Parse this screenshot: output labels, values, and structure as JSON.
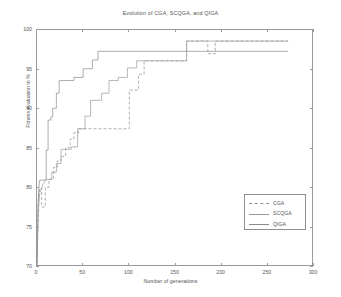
{
  "chart_data": {
    "type": "line",
    "title": "Evolution of CGA, SCQGA, and QIGA",
    "xlabel": "Number of generations",
    "ylabel": "Fitness evaluation in %",
    "xlim": [
      0,
      300
    ],
    "ylim": [
      70,
      100
    ],
    "xticks": [
      0,
      50,
      100,
      150,
      200,
      250,
      300
    ],
    "yticks": [
      70,
      75,
      80,
      85,
      90,
      95,
      100
    ],
    "grid": false,
    "legend_position": "lower-right-inside",
    "series": [
      {
        "name": "CGA",
        "style": "dashed",
        "color": "#8c8c8c",
        "points": [
          [
            0,
            70.0
          ],
          [
            1,
            76.5
          ],
          [
            2,
            79.2
          ],
          [
            3,
            80.0
          ],
          [
            5,
            80.0
          ],
          [
            5,
            77.6
          ],
          [
            9,
            77.6
          ],
          [
            9,
            80.1
          ],
          [
            13,
            80.1
          ],
          [
            13,
            81.1
          ],
          [
            18,
            81.1
          ],
          [
            18,
            82.6
          ],
          [
            22,
            82.6
          ],
          [
            22,
            83.4
          ],
          [
            26,
            83.4
          ],
          [
            26,
            84.0
          ],
          [
            31,
            84.0
          ],
          [
            31,
            85.1
          ],
          [
            36,
            85.1
          ],
          [
            36,
            86.2
          ],
          [
            40,
            86.2
          ],
          [
            40,
            87.0
          ],
          [
            45,
            87.0
          ],
          [
            45,
            87.5
          ],
          [
            100,
            87.5
          ],
          [
            100,
            92.4
          ],
          [
            110,
            92.4
          ],
          [
            110,
            94.4
          ],
          [
            116,
            94.4
          ],
          [
            116,
            96.1
          ],
          [
            162,
            96.1
          ],
          [
            162,
            98.6
          ],
          [
            185,
            98.6
          ],
          [
            185,
            97.0
          ],
          [
            193,
            97.0
          ],
          [
            193,
            98.6
          ],
          [
            272,
            98.6
          ]
        ]
      },
      {
        "name": "SCQGA",
        "style": "solid",
        "color": "#9a9a9a",
        "points": [
          [
            0,
            70.0
          ],
          [
            1,
            75.2
          ],
          [
            2,
            78.0
          ],
          [
            3,
            79.4
          ],
          [
            5,
            80.0
          ],
          [
            7,
            80.6
          ],
          [
            10,
            81.1
          ],
          [
            16,
            81.1
          ],
          [
            16,
            82.0
          ],
          [
            21,
            82.0
          ],
          [
            21,
            83.1
          ],
          [
            26,
            83.1
          ],
          [
            26,
            84.9
          ],
          [
            37,
            84.9
          ],
          [
            37,
            85.2
          ],
          [
            44,
            85.2
          ],
          [
            44,
            87.5
          ],
          [
            52,
            87.5
          ],
          [
            52,
            89.1
          ],
          [
            58,
            89.1
          ],
          [
            58,
            91.1
          ],
          [
            70,
            91.1
          ],
          [
            70,
            92.0
          ],
          [
            78,
            92.0
          ],
          [
            78,
            93.6
          ],
          [
            88,
            93.6
          ],
          [
            88,
            94.0
          ],
          [
            98,
            94.0
          ],
          [
            98,
            95.2
          ],
          [
            108,
            95.2
          ],
          [
            108,
            96.1
          ],
          [
            162,
            96.1
          ],
          [
            162,
            98.6
          ],
          [
            272,
            98.6
          ]
        ]
      },
      {
        "name": "QIGA",
        "style": "solid",
        "color": "#8a8a8a",
        "points": [
          [
            0,
            70.0
          ],
          [
            1,
            77.5
          ],
          [
            2,
            80.0
          ],
          [
            3,
            81.0
          ],
          [
            10,
            81.0
          ],
          [
            10,
            84.8
          ],
          [
            12,
            84.8
          ],
          [
            12,
            88.6
          ],
          [
            15,
            88.6
          ],
          [
            15,
            89.0
          ],
          [
            17,
            89.0
          ],
          [
            17,
            90.1
          ],
          [
            21,
            90.1
          ],
          [
            21,
            92.0
          ],
          [
            24,
            92.0
          ],
          [
            24,
            93.6
          ],
          [
            40,
            93.6
          ],
          [
            40,
            94.0
          ],
          [
            50,
            94.0
          ],
          [
            50,
            95.1
          ],
          [
            60,
            95.1
          ],
          [
            60,
            96.2
          ],
          [
            66,
            96.2
          ],
          [
            66,
            97.3
          ],
          [
            272,
            97.3
          ]
        ]
      }
    ]
  },
  "legend": {
    "items": [
      {
        "label": "CGA"
      },
      {
        "label": "SCQGA"
      },
      {
        "label": "QIGA"
      }
    ]
  }
}
